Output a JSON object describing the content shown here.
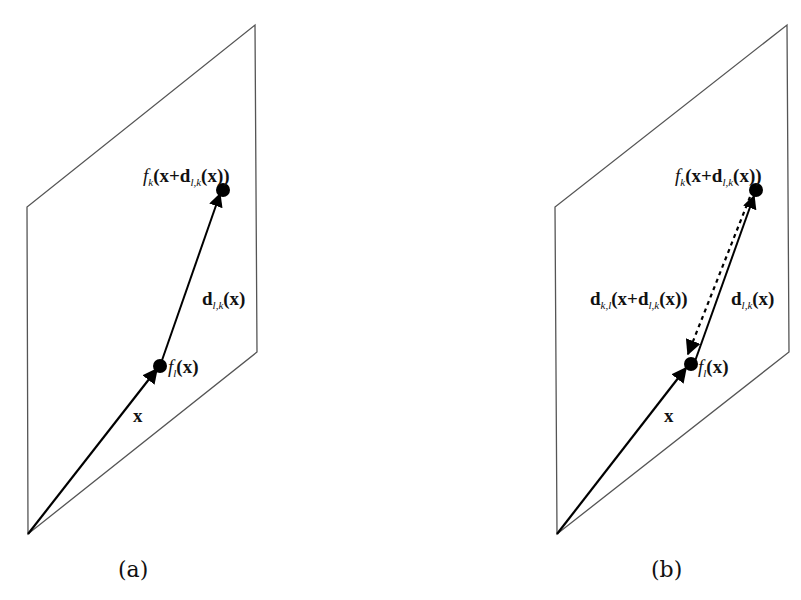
{
  "top_text_cropped": "",
  "panels": [
    {
      "id": "a",
      "caption": "(a)",
      "labels": {
        "fk_func": "f",
        "fk_sub": "k",
        "fk_arg_pre": "(x+",
        "fk_d": "d",
        "fk_d_sub": "l,k",
        "fk_arg_post": "(x))",
        "d_lk_d": "d",
        "d_lk_sub": "l,k",
        "d_lk_arg": "(x)",
        "fl_func": "f",
        "fl_sub": "l",
        "fl_arg": "(x)",
        "x": "x"
      }
    },
    {
      "id": "b",
      "caption": "(b)",
      "labels": {
        "fk_func": "f",
        "fk_sub": "k",
        "fk_arg_pre": "(x+",
        "fk_d": "d",
        "fk_d_sub": "l,k",
        "fk_arg_post": "(x))",
        "d_lk_d": "d",
        "d_lk_sub": "l,k",
        "d_lk_arg": "(x)",
        "d_kl_d": "d",
        "d_kl_sub": "k,l",
        "d_kl_arg_pre": "(x+",
        "d_kl_inner_d": "d",
        "d_kl_inner_sub": "l,k",
        "d_kl_arg_post": "(x))",
        "fl_func": "f",
        "fl_sub": "l",
        "fl_arg": "(x)",
        "x": "x"
      }
    }
  ]
}
